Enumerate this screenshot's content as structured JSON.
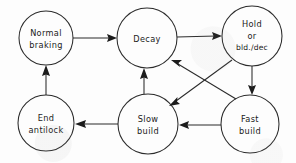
{
  "diagram": {
    "type": "state-transition-diagram",
    "style": "hand-drawn sketch, black ink on white paper",
    "canvas": {
      "width": 296,
      "height": 163
    },
    "nodes": [
      {
        "id": "normal-braking",
        "lines": [
          "Normal",
          "braking"
        ],
        "cx": 46,
        "cy": 38,
        "r": 27
      },
      {
        "id": "decay",
        "lines": [
          "Decay"
        ],
        "cx": 147,
        "cy": 38,
        "r": 30
      },
      {
        "id": "hold-or-bld-dec",
        "lines": [
          "Hold",
          "or",
          "bld./dec"
        ],
        "cx": 252,
        "cy": 36,
        "r": 30
      },
      {
        "id": "end-antilock",
        "lines": [
          "End",
          "antilock"
        ],
        "cx": 46,
        "cy": 123,
        "r": 28
      },
      {
        "id": "slow-build",
        "lines": [
          "Slow",
          "build"
        ],
        "cx": 148,
        "cy": 124,
        "r": 30
      },
      {
        "id": "fast-build",
        "lines": [
          "Fast",
          "build"
        ],
        "cx": 250,
        "cy": 124,
        "r": 29
      }
    ],
    "edges": [
      {
        "id": "normal-braking-to-decay",
        "from": "normal-braking",
        "to": "decay",
        "kind": "straight"
      },
      {
        "id": "decay-to-hold",
        "from": "decay",
        "to": "hold-or-bld-dec",
        "kind": "straight"
      },
      {
        "id": "hold-to-fast-build",
        "from": "hold-or-bld-dec",
        "to": "fast-build",
        "kind": "straight"
      },
      {
        "id": "fast-build-to-slow-build",
        "from": "fast-build",
        "to": "slow-build",
        "kind": "straight"
      },
      {
        "id": "slow-build-to-end-antilock",
        "from": "slow-build",
        "to": "end-antilock",
        "kind": "straight"
      },
      {
        "id": "end-antilock-to-normal-braking",
        "from": "end-antilock",
        "to": "normal-braking",
        "kind": "straight"
      },
      {
        "id": "slow-build-to-decay",
        "from": "slow-build",
        "to": "decay",
        "kind": "straight"
      },
      {
        "id": "fast-build-to-decay",
        "from": "fast-build",
        "to": "decay",
        "kind": "diagonal"
      },
      {
        "id": "hold-to-slow-build",
        "from": "hold-or-bld-dec",
        "to": "slow-build",
        "kind": "diagonal"
      }
    ],
    "colors": {
      "ink": "#2b2b2b",
      "paper": "#fdfdfd",
      "arrow": "#1c1c1c"
    }
  }
}
